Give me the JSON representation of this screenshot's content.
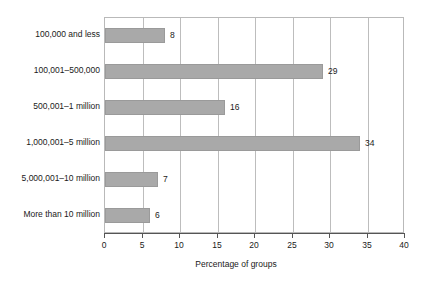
{
  "chart_data": {
    "type": "bar",
    "orientation": "horizontal",
    "title": "",
    "xlabel": "Percentage of groups",
    "ylabel": "",
    "xlim": [
      0,
      40
    ],
    "xticks": [
      "0",
      "5",
      "10",
      "15",
      "20",
      "25",
      "30",
      "35",
      "40"
    ],
    "grid": true,
    "legend": null,
    "categories": [
      "100,000 and less",
      "100,001–500,000",
      "500,001–1 million",
      "1,000,001–5 million",
      "5,000,001–10 million",
      "More than 10 million"
    ],
    "values": [
      8,
      29,
      16,
      34,
      7,
      6
    ],
    "value_labels": [
      "8",
      "29",
      "16",
      "34",
      "7",
      "6"
    ],
    "bar_color": "#a9a9a9",
    "gridline_color": "#bdbdbd",
    "axis_color": "#555555"
  }
}
